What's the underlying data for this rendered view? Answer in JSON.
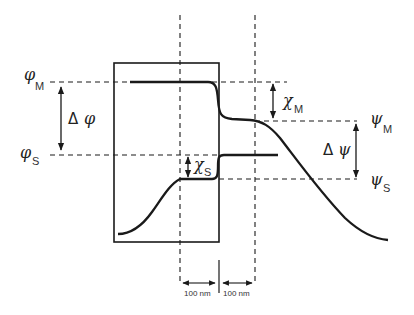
{
  "diagram": {
    "labels": {
      "phi_M": {
        "symbol": "φ",
        "sub": "M"
      },
      "phi_S": {
        "symbol": "φ",
        "sub": "S"
      },
      "delta_phi": {
        "delta": "Δ",
        "symbol": "φ"
      },
      "chi_M": {
        "symbol": "χ",
        "sub": "M"
      },
      "chi_S": {
        "symbol": "χ",
        "sub": "S"
      },
      "psi_M": {
        "symbol": "ψ",
        "sub": "M"
      },
      "psi_S": {
        "symbol": "ψ",
        "sub": "S"
      },
      "delta_psi": {
        "delta": "Δ",
        "symbol": "ψ"
      }
    },
    "scale_labels": [
      "100 nm",
      "100 nm"
    ],
    "colors": {
      "line": "#1a1a1a",
      "background": "#ffffff"
    }
  }
}
